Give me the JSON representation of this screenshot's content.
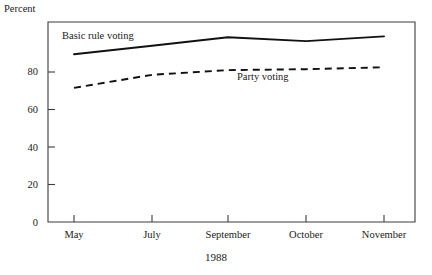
{
  "chart_data": {
    "type": "line",
    "title": "",
    "xlabel": "1988",
    "ylabel": "Percent",
    "categories": [
      "May",
      "July",
      "September",
      "October",
      "November"
    ],
    "ylim": [
      0,
      100
    ],
    "yticks": [
      0,
      20,
      40,
      60,
      80
    ],
    "ytick_labels": [
      "0",
      "20",
      "40",
      "60",
      "80"
    ],
    "grid": false,
    "legend_position": "inline-annotation",
    "series": [
      {
        "name": "Basic rule voting",
        "style": "solid",
        "values": [
          89.5,
          94,
          98.5,
          96.5,
          99
        ]
      },
      {
        "name": "Party voting",
        "style": "dashed",
        "values": [
          71.5,
          78.5,
          81,
          81.5,
          82.5
        ]
      }
    ],
    "annotations": [
      {
        "text": "Basic rule voting",
        "x_px": 62,
        "y_px": 30
      },
      {
        "text": "Party voting",
        "x_px": 237,
        "y_px": 71
      }
    ]
  },
  "axis": {
    "y_title": "Percent",
    "x_title": "1988",
    "y_tick_0": "0",
    "y_tick_20": "20",
    "y_tick_40": "40",
    "y_tick_60": "60",
    "y_tick_80": "80",
    "x_tick_may": "May",
    "x_tick_july": "July",
    "x_tick_september": "September",
    "x_tick_october": "October",
    "x_tick_november": "November"
  },
  "colors": {
    "series_line": "#111111",
    "frame": "#3c3c3c",
    "background": "#ffffff",
    "text": "#1a1a1a"
  }
}
